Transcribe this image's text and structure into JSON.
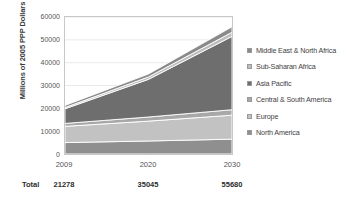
{
  "chart_data": {
    "type": "area",
    "stacked": true,
    "title": "",
    "xlabel": "",
    "ylabel": "Millions of 2005 PPP Dollars",
    "x": [
      "2009",
      "2020",
      "2030"
    ],
    "categories": [
      "2009",
      "2020",
      "2030"
    ],
    "ylim": [
      0,
      60000
    ],
    "yticks": [
      0,
      10000,
      20000,
      30000,
      40000,
      50000,
      60000
    ],
    "ytick_labels": [
      "0",
      "10000",
      "20000",
      "30000",
      "40000",
      "50000",
      "60000"
    ],
    "grid": true,
    "legend_position": "right",
    "series": [
      {
        "name": "North America",
        "values": [
          5000,
          5700,
          6500
        ],
        "color": "#8f8f8f"
      },
      {
        "name": "Europe",
        "values": [
          7100,
          8700,
          10500
        ],
        "color": "#c2c2c2"
      },
      {
        "name": "Central & South America",
        "values": [
          1300,
          1800,
          2400
        ],
        "color": "#a8a8a8"
      },
      {
        "name": "Asia Pacific",
        "values": [
          6400,
          16500,
          32100
        ],
        "color": "#6e6e6e"
      },
      {
        "name": "Sub-Saharan Africa",
        "values": [
          550,
          1050,
          1800
        ],
        "color": "#bdbdbd"
      },
      {
        "name": "Middle East & North Africa",
        "values": [
          928,
          1295,
          2380
        ],
        "color": "#8a8a8a"
      }
    ],
    "legend_order_top_to_bottom": [
      "Middle East & North Africa",
      "Sub-Saharan Africa",
      "Asia Pacific",
      "Central & South America",
      "Europe",
      "North America"
    ],
    "totals_row_label": "Total",
    "totals": [
      "21278",
      "35045",
      "55680"
    ],
    "annotations": []
  },
  "axis": {
    "y_title": "Millions of 2005 PPP Dollars",
    "yticks": [
      "60000",
      "50000",
      "40000",
      "30000",
      "20000",
      "10000",
      "0"
    ],
    "xticks": [
      "2009",
      "2020",
      "2030"
    ]
  },
  "totals": {
    "label": "Total",
    "values": [
      "21278",
      "35045",
      "55680"
    ]
  },
  "legend": {
    "items": [
      {
        "label": "Middle East & North Africa",
        "color": "#8a8a8a"
      },
      {
        "label": "Sub-Saharan Africa",
        "color": "#bdbdbd"
      },
      {
        "label": "Asia Pacific",
        "color": "#6e6e6e"
      },
      {
        "label": "Central & South America",
        "color": "#a8a8a8"
      },
      {
        "label": "Europe",
        "color": "#c2c2c2"
      },
      {
        "label": "North America",
        "color": "#8f8f8f"
      }
    ]
  }
}
